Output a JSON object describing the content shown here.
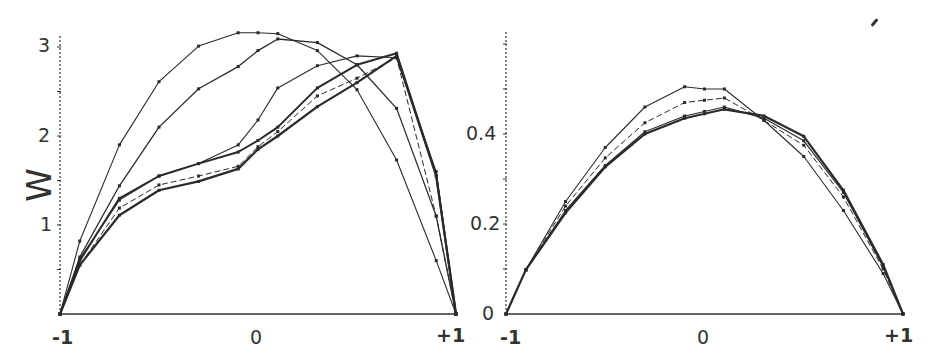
{
  "chart_data": [
    {
      "type": "line",
      "title": "",
      "xlabel": "",
      "ylabel": "W",
      "xlim": [
        -1,
        1
      ],
      "ylim": [
        0,
        3.2
      ],
      "grid": false,
      "legend": null,
      "x_tick_labels": [
        "-1",
        "0",
        "+1"
      ],
      "y_tick_labels": [
        "1",
        "2",
        "3"
      ],
      "x": [
        -1,
        -0.9,
        -0.7,
        -0.5,
        -0.3,
        -0.1,
        0,
        0.1,
        0.3,
        0.5,
        0.7,
        0.9,
        1
      ],
      "series": [
        {
          "name": "A",
          "values": [
            0,
            0.82,
            1.9,
            2.61,
            3.01,
            3.16,
            3.16,
            3.15,
            2.96,
            2.52,
            1.73,
            0.6,
            0
          ],
          "width": 1.1
        },
        {
          "name": "B",
          "values": [
            0,
            0.64,
            1.44,
            2.1,
            2.53,
            2.78,
            2.96,
            3.09,
            3.05,
            2.8,
            2.31,
            1.1,
            0
          ],
          "width": 1.3
        },
        {
          "name": "C",
          "values": [
            0,
            0.62,
            1.28,
            1.55,
            1.69,
            1.9,
            2.18,
            2.54,
            2.79,
            2.9,
            2.88,
            1.6,
            0
          ],
          "width": 1.1
        },
        {
          "name": "D",
          "values": [
            0,
            0.6,
            1.3,
            1.55,
            1.69,
            1.82,
            1.95,
            2.1,
            2.54,
            2.8,
            2.93,
            1.56,
            0
          ],
          "width": 2.0
        },
        {
          "name": "E",
          "values": [
            0,
            0.55,
            1.19,
            1.45,
            1.55,
            1.66,
            1.88,
            2.05,
            2.45,
            2.65,
            2.88,
            1.1,
            0
          ],
          "width": 1.0,
          "dash": "6,3"
        },
        {
          "name": "F",
          "values": [
            0,
            0.55,
            1.11,
            1.39,
            1.49,
            1.63,
            1.85,
            2.0,
            2.33,
            2.6,
            2.9,
            1.55,
            0
          ],
          "width": 2.2
        }
      ]
    },
    {
      "type": "line",
      "title": "",
      "xlabel": "",
      "ylabel": "",
      "xlim": [
        -1,
        1
      ],
      "ylim": [
        0,
        0.62
      ],
      "grid": false,
      "legend": null,
      "x_tick_labels": [
        "-1",
        "0",
        "+1"
      ],
      "y_tick_labels": [
        "0",
        "0.2",
        "0.4"
      ],
      "x": [
        -1,
        -0.9,
        -0.7,
        -0.5,
        -0.3,
        -0.1,
        0,
        0.1,
        0.3,
        0.5,
        0.7,
        0.9,
        1
      ],
      "series": [
        {
          "name": "P",
          "values": [
            0,
            0.098,
            0.25,
            0.37,
            0.46,
            0.505,
            0.5,
            0.5,
            0.43,
            0.35,
            0.23,
            0.09,
            0
          ],
          "width": 1.1
        },
        {
          "name": "Q",
          "values": [
            0,
            0.098,
            0.24,
            0.347,
            0.425,
            0.47,
            0.475,
            0.48,
            0.43,
            0.375,
            0.26,
            0.1,
            0
          ],
          "width": 1.0,
          "dash": "6,3"
        },
        {
          "name": "R",
          "values": [
            0,
            0.098,
            0.23,
            0.33,
            0.405,
            0.44,
            0.45,
            0.46,
            0.435,
            0.385,
            0.27,
            0.105,
            0
          ],
          "width": 1.2
        },
        {
          "name": "S",
          "values": [
            0,
            0.098,
            0.225,
            0.327,
            0.4,
            0.435,
            0.445,
            0.455,
            0.44,
            0.395,
            0.275,
            0.11,
            0
          ],
          "width": 2.2
        }
      ]
    }
  ],
  "left_chart": {
    "ylabel": "W",
    "x_ticks": [
      "-1",
      "0",
      "+1"
    ],
    "y_ticks": [
      "1",
      "2",
      "3"
    ]
  },
  "right_chart": {
    "x_ticks": [
      "-1",
      "0",
      "+1"
    ],
    "y_ticks": [
      "0",
      "0.2",
      "0.4"
    ]
  },
  "colors": {
    "line": "#2a2a2a",
    "axis": "#333333",
    "background": "#ffffff"
  }
}
